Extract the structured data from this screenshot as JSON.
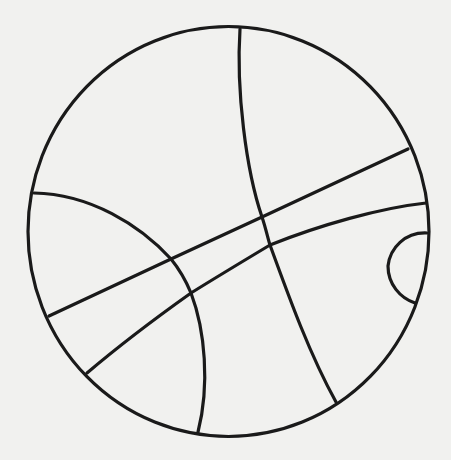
{
  "drawing": {
    "subject": "basketball line drawing",
    "stroke_color": "#1a1a1a",
    "background_color": "#f1f1ef",
    "stroke_width": 3.2,
    "outline": {
      "cx": 228.5,
      "cy": 231.5,
      "rx": 200.5,
      "ry": 205
    },
    "seams": [
      {
        "name": "vertical-seam",
        "d": "M240,29 C236,90 246,170 262,217 C266,229 268,239 270,245 C290,300 310,355 336,402"
      },
      {
        "name": "left-arc-seam",
        "d": "M34,193 C90,194 140,225 171,259 C180,270 186,281 191,293 C205,330 210,385 198,432"
      },
      {
        "name": "upper-band-seam",
        "d": "M49,316 L171,259 L262,217 L408,149"
      },
      {
        "name": "lower-band-seam",
        "d": "M87,373 C120,345 160,315 191,293 C215,278 245,260 270,245 C320,225 380,208 426,203"
      },
      {
        "name": "small-arc-seam",
        "d": "M427,233 C405,232 390,248 388,266 C388,284 400,298 415,303"
      }
    ]
  }
}
